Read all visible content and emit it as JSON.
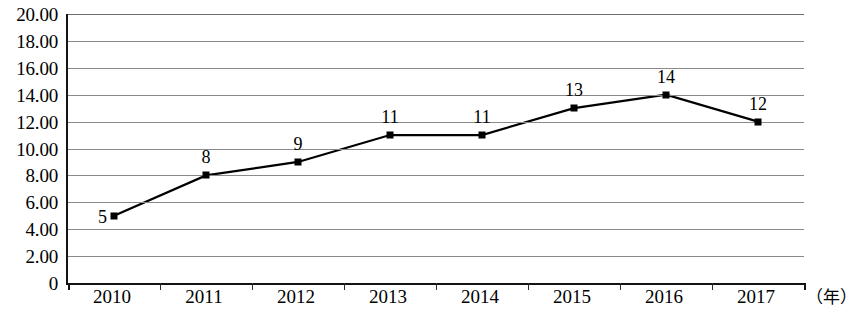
{
  "chart_data": {
    "type": "line",
    "title": "",
    "xlabel": "（年）",
    "ylabel": "",
    "categories": [
      "2010",
      "2011",
      "2012",
      "2013",
      "2014",
      "2015",
      "2016",
      "2017"
    ],
    "values": [
      5,
      8,
      9,
      11,
      11,
      13,
      14,
      12
    ],
    "point_labels": [
      "5",
      "8",
      "9",
      "11",
      "11",
      "13",
      "14",
      "12"
    ],
    "ylim": [
      0,
      20
    ],
    "ytick_labels": [
      "20.00",
      "18.00",
      "16.00",
      "14.00",
      "12.00",
      "10.00",
      "8.00",
      "6.00",
      "4.00",
      "2.00",
      "0"
    ],
    "ytick_values": [
      20,
      18,
      16,
      14,
      12,
      10,
      8,
      6,
      4,
      2,
      0
    ],
    "grid": true,
    "legend": "none",
    "series_color": "#000000",
    "grid_color": "#8a8a8a",
    "axis_color": "#141414",
    "marker_shape": "square"
  }
}
